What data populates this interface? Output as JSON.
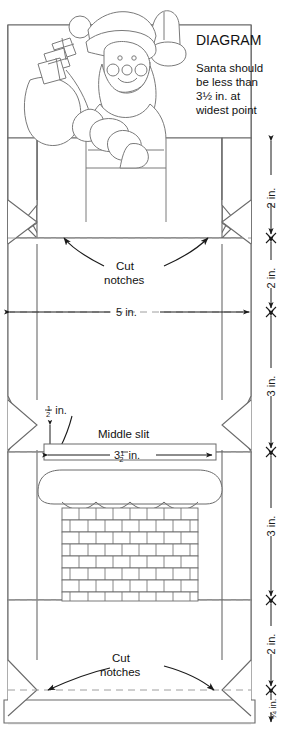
{
  "diagram": {
    "title": "DIAGRAM",
    "note_lines": [
      "Santa should",
      "be less than",
      "3½ in. at",
      "widest point"
    ],
    "note_full": "Santa should be less than 3½ in. at widest point",
    "illustration_name": "santa-waving-with-chimney-sack",
    "colors": {
      "line": "#5a5a5a",
      "dimension": "#1a1a1a",
      "fold_dashed": "#9a9a9a",
      "panel_fill": "#ffffff",
      "shadow": "#ededed"
    }
  },
  "labels": {
    "cut_notches_top": "Cut\nnotches",
    "cut_notches_top_l1": "Cut",
    "cut_notches_top_l2": "notches",
    "cut_notches_bottom_l1": "Cut",
    "cut_notches_bottom_l2": "notches",
    "middle_slit": "Middle slit",
    "half_inch": "½ in.",
    "width_5in": "5 in.",
    "slit_width": "3½ in."
  },
  "vertical_dimensions": [
    {
      "id": "seg-1",
      "value": "2 in.",
      "order": 1
    },
    {
      "id": "seg-2",
      "value": "2 in.",
      "order": 2
    },
    {
      "id": "seg-3",
      "value": "3 in.",
      "order": 3
    },
    {
      "id": "seg-4",
      "value": "3 in.",
      "order": 4
    },
    {
      "id": "seg-5",
      "value": "2 in.",
      "order": 5
    },
    {
      "id": "seg-6",
      "value": "¾ in.",
      "order": 6
    }
  ],
  "horizontal_dimensions": [
    {
      "id": "body-width",
      "value": "5 in."
    },
    {
      "id": "slit-width",
      "value": "3½ in."
    },
    {
      "id": "notch-depth",
      "value": "½ in."
    }
  ],
  "chimney": {
    "name": "brick-chimney-with-snow",
    "brick_rows": 9
  }
}
